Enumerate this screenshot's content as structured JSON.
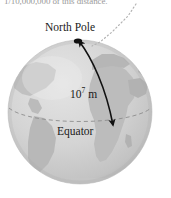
{
  "figure": {
    "title_caption_clipped": "1/10,000,000 of this distance.",
    "labels": {
      "north_pole": "North Pole",
      "distance_base": "10",
      "distance_exponent": "7",
      "distance_unit": " m",
      "equator": "Equator"
    },
    "colors": {
      "background": "#ffffff",
      "ocean": "#d2d2d2",
      "land": "#bdbdbd",
      "land_dark": "#b0b0b0",
      "globe_edge": "#c2c2c2",
      "arrow": "#111111",
      "leader_line": "#b4b4b4",
      "equator_line": "#8f8f8f",
      "caption_text": "#9a9a9a",
      "label_text": "#1a1a1a"
    },
    "geometry": {
      "globe_center_x": 80,
      "globe_center_y": 112,
      "globe_radius": 72,
      "arrow_start_x": 78,
      "arrow_start_y": 39,
      "arrow_end_x": 113,
      "arrow_end_y": 128
    },
    "annotations": {
      "arrow_description": "double-headed curved arrow from North Pole to Equator",
      "leader_description": "dotted leader line from caption to North Pole",
      "equator_description": "dashed ellipse marking the Equator"
    }
  }
}
